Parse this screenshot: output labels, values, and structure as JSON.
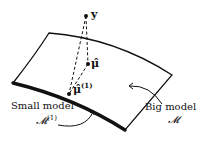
{
  "diagram": {
    "type": "geometric projection diagram",
    "points": {
      "y": {
        "label": "y",
        "x": 86,
        "y": 16
      },
      "mu_hat": {
        "label": "μ̂",
        "x": 88,
        "y": 64
      },
      "mu_hat_1": {
        "label": "μ̂",
        "superscript": "(1)",
        "x": 69,
        "y": 94
      }
    },
    "labels": {
      "small_model": "Small model",
      "small_model_symbol": "𝓜",
      "small_model_superscript": "(1)",
      "big_model": "Big model",
      "big_model_symbol": "𝓜"
    },
    "edges": [
      {
        "from": "y",
        "to": "mu_hat",
        "style": "dashed"
      },
      {
        "from": "y",
        "to": "mu_hat_1",
        "style": "dashed"
      },
      {
        "from": "mu_hat",
        "to": "mu_hat_1",
        "style": "dashed"
      }
    ],
    "colors": {
      "ink": "#111111",
      "background": "#ffffff"
    }
  }
}
